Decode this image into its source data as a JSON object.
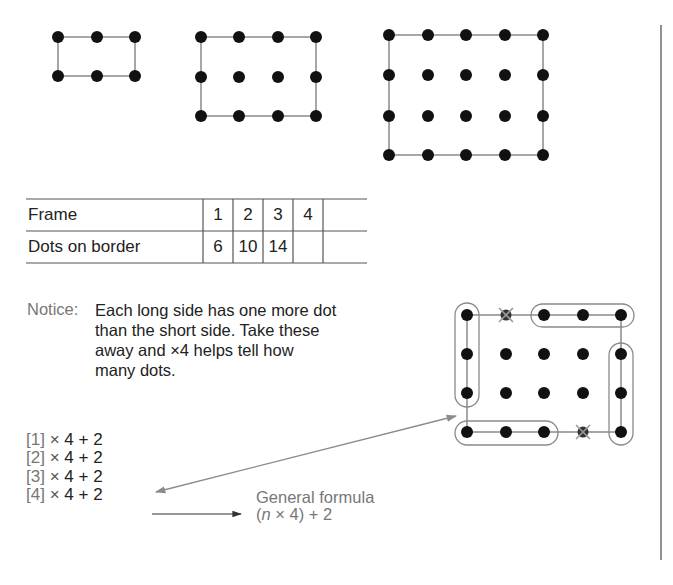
{
  "frames": [
    {
      "id": 1,
      "cols": [
        58,
        97,
        135
      ],
      "rows": [
        37,
        76
      ]
    },
    {
      "id": 2,
      "cols": [
        201,
        239,
        278,
        316
      ],
      "rows": [
        37,
        77,
        116
      ]
    },
    {
      "id": 3,
      "cols": [
        389,
        428,
        466,
        505,
        543
      ],
      "rows": [
        35,
        75,
        116,
        155
      ]
    }
  ],
  "table": {
    "row_labels": [
      "Frame",
      "Dots on border"
    ],
    "frame_values": [
      "1",
      "2",
      "3",
      "4",
      ""
    ],
    "dot_values": [
      "6",
      "10",
      "14",
      "",
      ""
    ]
  },
  "notice": {
    "label": "Notice:",
    "lines": [
      "Each long side has one more dot",
      "than the short side. Take these",
      "away and ×4 helps tell how",
      "many dots."
    ]
  },
  "formulas": [
    {
      "bracket": "[1]",
      "times": "×",
      "rest": "4 + 2"
    },
    {
      "bracket": "[2]",
      "times": "×",
      "rest": "4 + 2"
    },
    {
      "bracket": "[3]",
      "times": "×",
      "rest": "4 + 2"
    },
    {
      "bracket": "[4]",
      "times": "×",
      "rest": "4 + 2"
    }
  ],
  "general": {
    "title": "General formula",
    "open": "(",
    "var": "n",
    "rest": " × 4) + 2"
  },
  "illustration": {
    "cols": [
      467,
      506,
      544,
      583,
      621
    ],
    "rows": [
      315,
      354,
      393,
      432
    ],
    "crossed": [
      [
        506,
        315
      ],
      [
        583,
        432
      ]
    ]
  },
  "colors": {
    "dot": "#111111",
    "line": "#8a8a8a",
    "loop": "#8a8a8a",
    "text": "#222222",
    "muted": "#777777"
  }
}
